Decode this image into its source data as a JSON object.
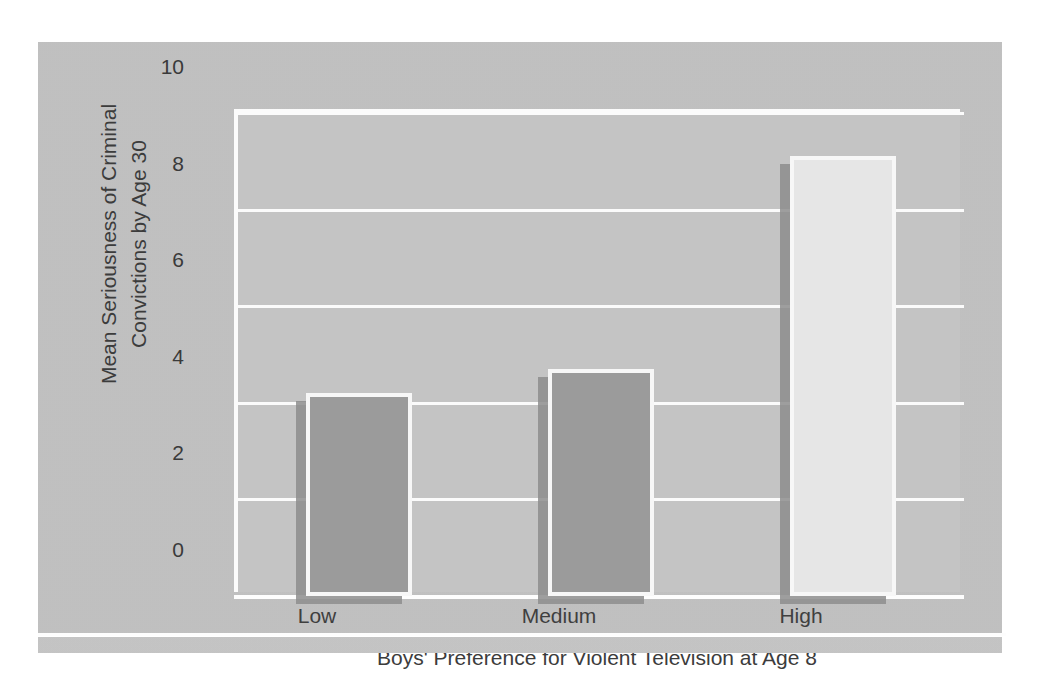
{
  "chart_data": {
    "type": "bar",
    "title": "",
    "categories": [
      "Low",
      "Medium",
      "High"
    ],
    "values": [
      4.2,
      4.7,
      9.1
    ],
    "series": [
      {
        "name": "Mean Seriousness of Criminal Convictions by Age 30",
        "values": [
          4.2,
          4.7,
          9.1
        ]
      }
    ],
    "xlabel": "Boys' Preference for Violent Television at Age 8",
    "ylabel_line1": "Mean Seriousness of Criminal",
    "ylabel_line2": "Convictions by Age 30",
    "ylabel": "Mean Seriousness of Criminal Convictions by Age 30",
    "ylim": [
      0,
      10
    ],
    "yticks": [
      "0",
      "2",
      "4",
      "6",
      "8",
      "10"
    ],
    "ytick_values": [
      0,
      2,
      4,
      6,
      8,
      10
    ],
    "grid": true,
    "legend": false,
    "bar_colors": [
      "#9b9b9b",
      "#9b9b9b",
      "#e6e6e6"
    ],
    "bar_border_color": "#f7f7f7",
    "bar_shadow_color": "#8d8d8d",
    "plot_background": "#c4c4c4",
    "gridline_color": "#fbfbfb",
    "text_color": "#3c3c3c",
    "page_background": "#ffffff"
  }
}
